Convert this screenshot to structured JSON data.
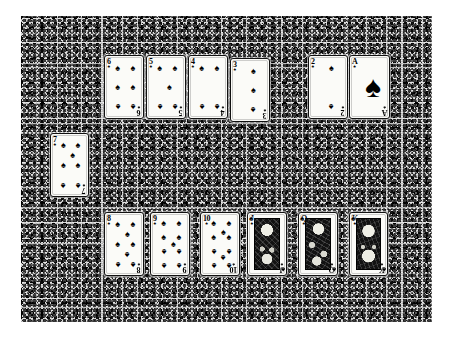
{
  "scene": {
    "title": "Spade suit laid out on a textured surface",
    "suit_symbol": "♠",
    "suit_name": "spades",
    "background_color": "#d9d9d9",
    "card_face_color": "#fbfbf8",
    "ink_color": "#000000"
  },
  "rows": {
    "top": {
      "name": "top-row",
      "cards": [
        {
          "rank": "6",
          "suit": "♠",
          "label": "6 of spades",
          "pips": 6,
          "court": false
        },
        {
          "rank": "5",
          "suit": "♠",
          "label": "5 of spades",
          "pips": 5,
          "court": false
        },
        {
          "rank": "4",
          "suit": "♠",
          "label": "4 of spades",
          "pips": 4,
          "court": false
        },
        {
          "rank": "3",
          "suit": "♠",
          "label": "3 of spades",
          "pips": 3,
          "court": false
        },
        {
          "rank": "2",
          "suit": "♠",
          "label": "2 of spades",
          "pips": 2,
          "court": false
        },
        {
          "rank": "A",
          "suit": "♠",
          "label": "Ace of spades",
          "pips": 1,
          "court": false
        }
      ]
    },
    "single": {
      "name": "offset-card",
      "cards": [
        {
          "rank": "7",
          "suit": "♠",
          "label": "7 of spades",
          "pips": 7,
          "court": false
        }
      ]
    },
    "bottom": {
      "name": "bottom-row",
      "cards": [
        {
          "rank": "8",
          "suit": "♠",
          "label": "8 of spades",
          "pips": 8,
          "court": false
        },
        {
          "rank": "9",
          "suit": "♠",
          "label": "9 of spades",
          "pips": 9,
          "court": false
        },
        {
          "rank": "10",
          "suit": "♠",
          "label": "10 of spades",
          "pips": 10,
          "court": false
        },
        {
          "rank": "J",
          "suit": "♠",
          "label": "Jack of spades",
          "pips": 0,
          "court": true
        },
        {
          "rank": "Q",
          "suit": "♠",
          "label": "Queen of spades",
          "pips": 0,
          "court": true
        },
        {
          "rank": "K",
          "suit": "♠",
          "label": "King of spades",
          "pips": 0,
          "court": true
        }
      ]
    }
  }
}
